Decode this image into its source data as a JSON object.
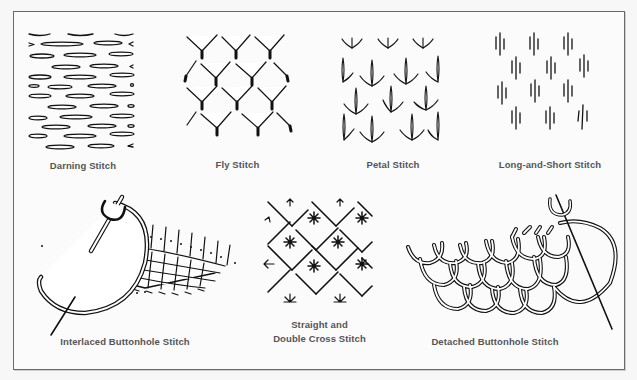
{
  "figure": {
    "panels": [
      {
        "id": "darning",
        "label": "Darning Stitch"
      },
      {
        "id": "fly",
        "label": "Fly Stitch"
      },
      {
        "id": "petal",
        "label": "Petal Stitch"
      },
      {
        "id": "long-short",
        "label": "Long-and-Short Stitch"
      },
      {
        "id": "interlaced-buttonhole",
        "label": "Interlaced Buttonhole Stitch"
      },
      {
        "id": "straight-double-cross",
        "label_line1": "Straight and",
        "label_line2": "Double Cross Stitch"
      },
      {
        "id": "detached-buttonhole",
        "label": "Detached Buttonhole Stitch"
      }
    ]
  },
  "colors": {
    "background": "#f7f7f7",
    "frame_border": "#6a6a6a",
    "ink": "#111111",
    "label_text": "#555555"
  }
}
